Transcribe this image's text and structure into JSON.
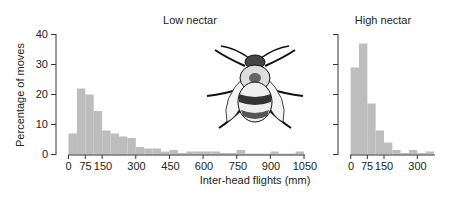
{
  "chart_data": [
    {
      "type": "bar",
      "title": "Low nectar",
      "xlabel": "Inter-head flights (mm)",
      "ylabel": "Percentage of moves",
      "ylim": [
        0,
        40
      ],
      "yticks": [
        0,
        10,
        20,
        30,
        40
      ],
      "xticks": [
        0,
        75,
        150,
        300,
        450,
        600,
        750,
        900,
        1050
      ],
      "bin_width": 37.5,
      "bins_start": [
        0,
        37.5,
        75,
        112.5,
        150,
        187.5,
        225,
        262.5,
        300,
        337.5,
        375,
        412.5,
        450,
        487.5,
        525,
        562.5,
        600,
        637.5,
        675,
        712.5,
        750,
        787.5,
        825,
        862.5,
        900,
        937.5,
        975,
        1012.5
      ],
      "values": [
        7,
        22,
        20,
        14.5,
        8,
        7,
        6,
        5.5,
        2.5,
        2,
        2,
        1,
        1.5,
        0.5,
        1,
        1,
        1,
        1,
        0.5,
        0.5,
        1.5,
        0.3,
        0.3,
        0.3,
        1,
        0.3,
        0.3,
        1
      ],
      "grid": false
    },
    {
      "type": "bar",
      "title": "High nectar",
      "xlabel": "Inter-head flights (mm)",
      "ylabel": "Percentage of moves",
      "ylim": [
        0,
        40
      ],
      "xticks": [
        0,
        75,
        150,
        300
      ],
      "bin_width": 37.5,
      "bins_start": [
        0,
        37.5,
        75,
        112.5,
        150,
        187.5,
        225,
        262.5,
        300,
        337.5
      ],
      "values": [
        29,
        37,
        17,
        8,
        4,
        1.5,
        0.5,
        1.5,
        0.5,
        1
      ],
      "grid": false
    }
  ],
  "labels": {
    "low_title": "Low nectar",
    "high_title": "High nectar",
    "xlabel": "Inter-head flights (mm)",
    "ylabel": "Percentage of moves",
    "low_xticks": [
      "0",
      "75",
      "150",
      "300",
      "450",
      "600",
      "750",
      "900",
      "1050"
    ],
    "high_xticks": [
      "0",
      "75",
      "150",
      "300"
    ],
    "yticks": [
      "0",
      "10",
      "20",
      "30",
      "40"
    ]
  },
  "colors": {
    "bar": "#bdbdbd",
    "axis": "#333333"
  },
  "illustration": "bumblebee-drawing"
}
